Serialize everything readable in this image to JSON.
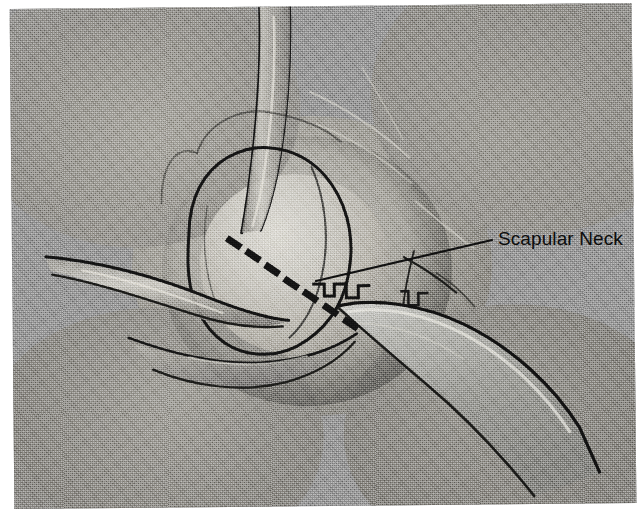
{
  "figure": {
    "kind": "surgical-illustration",
    "medium": "halftone-screened grayscale photograph",
    "canvas": {
      "width": 644,
      "height": 523
    },
    "plate": {
      "left": 12,
      "top": 6,
      "width": 622,
      "height": 500,
      "skew_deg": -0.55
    }
  },
  "annotations": [
    {
      "id": "scapular-neck",
      "label": "Scapular Neck",
      "text_x": 498,
      "text_y": 228,
      "font_size": 19,
      "color": "#0d0d0d",
      "leader": {
        "from_x": 492,
        "from_y": 240,
        "to_x": 316,
        "to_y": 281,
        "width": 2.2,
        "color": "#111111"
      }
    }
  ],
  "osteotomy_line": {
    "name": "dashed osteotomy line",
    "style": "dashed",
    "color": "#141414",
    "dash_count": 7,
    "dash_length": 17,
    "dash_thickness": 7,
    "dash_angle_deg": 34,
    "start_x": 222,
    "start_y": 236,
    "end_x": 338,
    "end_y": 318,
    "dashes": [
      {
        "x": 222,
        "y": 236
      },
      {
        "x": 241,
        "y": 249
      },
      {
        "x": 260,
        "y": 263
      },
      {
        "x": 279,
        "y": 277
      },
      {
        "x": 298,
        "y": 290
      },
      {
        "x": 318,
        "y": 304
      },
      {
        "x": 338,
        "y": 318
      }
    ]
  },
  "palette": {
    "page_background": "#ffffff",
    "field_midtone": "#9c9c9c",
    "bone_highlight": "#dcdcd6",
    "bone_midtone": "#b4b1a9",
    "tissue_shadow": "#6a6a68",
    "deep_shadow": "#4a4a48",
    "retractor_metal": "#a9a9a5",
    "retractor_highlight": "#d2d2ce",
    "ink_black": "#111111"
  },
  "structures": [
    {
      "id": "glenoid-head",
      "name": "Glenoid / humeral head",
      "role": "bone",
      "note": "central rounded illuminated dome"
    },
    {
      "id": "scapular-neck-region",
      "name": "Scapular neck",
      "role": "bone",
      "note": "target of the leader line, below and right of the head"
    },
    {
      "id": "retractor-blade",
      "name": "Broad retractor blade",
      "role": "instrument",
      "note": "wide flat blade entering from lower right"
    },
    {
      "id": "toothed-retractor",
      "name": "Toothed retractor edge",
      "role": "instrument",
      "note": "notched teeth along the blade shoulder"
    },
    {
      "id": "superior-band",
      "name": "Retracted muscle / tendon band",
      "role": "soft-tissue",
      "note": "vertical band descending from the top edge"
    },
    {
      "id": "left-retractor",
      "name": "Left tissue retractor",
      "role": "instrument",
      "note": "slim band entering from the left margin"
    },
    {
      "id": "inferior-fold",
      "name": "Inferior soft-tissue fold",
      "role": "soft-tissue",
      "note": "curved fold across the lower field"
    },
    {
      "id": "lateral-strands",
      "name": "Lateral fascial strands",
      "role": "soft-tissue",
      "note": "thin branching lines to the right of the blade"
    }
  ]
}
